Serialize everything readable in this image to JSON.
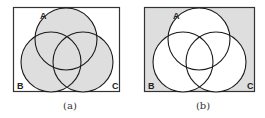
{
  "figure": {
    "colors": {
      "shade": "#dedede",
      "stroke": "#1a1a1a",
      "frame": "#333333",
      "background": "#ffffff"
    },
    "panels": [
      {
        "id": "a",
        "caption": "(a)",
        "description": "A ∪ B ∪ C shaded; universe outside unshaded",
        "labels": {
          "a": "A",
          "b": "B",
          "c": "C"
        }
      },
      {
        "id": "b",
        "caption": "(b)",
        "description": "Complement of A ∪ B ∪ C shaded; circles unshaded",
        "labels": {
          "a": "A",
          "b": "B",
          "c": "C"
        }
      }
    ]
  }
}
